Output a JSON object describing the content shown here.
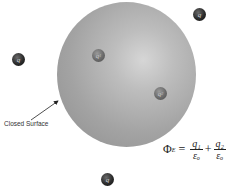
{
  "diagram": {
    "surface_label": "Closed Surface",
    "charges_inside": [
      {
        "label": "q",
        "sub": "1"
      },
      {
        "label": "q",
        "sub": "2"
      }
    ],
    "charges_outside": [
      {
        "label": "q",
        "sub": ""
      },
      {
        "label": "q",
        "sub": ""
      },
      {
        "label": "q",
        "sub": ""
      }
    ],
    "formula": {
      "lhs": "Φ",
      "lhs_sub": "E",
      "equals": "=",
      "term1_num": "q₁",
      "term1_den": "εₒ",
      "plus": "+",
      "term2_num": "q₂",
      "term2_den": "εₒ"
    }
  }
}
